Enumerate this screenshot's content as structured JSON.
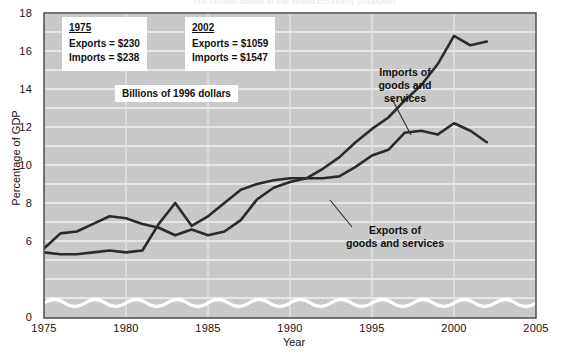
{
  "figure": {
    "top_cut_title": "The United States in the World Economy (cropped)"
  },
  "axes": {
    "y_label": "Percentage of GDP",
    "x_label": "Year",
    "y_ticks": [
      "18",
      "16",
      "14",
      "12",
      "10",
      "8",
      "6",
      "0"
    ],
    "x_ticks": [
      "1975",
      "1980",
      "1985",
      "1990",
      "1995",
      "2000",
      "2005"
    ]
  },
  "annotations": {
    "imports_callout": [
      "Imports of",
      "goods and",
      "services"
    ],
    "exports_callout": [
      "Exports of",
      "goods and services"
    ],
    "unit_note": "Billions of 1996 dollars",
    "box_1975": {
      "year": "1975",
      "exports": "Exports  =  $230",
      "imports": "Imports  =  $238"
    },
    "box_2002": {
      "year": "2002",
      "exports": "Exports  =  $1059",
      "imports": "Imports  =  $1547"
    }
  },
  "colors": {
    "plot_background": "#c9c9c9",
    "gridline": "#efefef",
    "line": "#2b2b2b",
    "axis_break": "#ffffff",
    "frame": "#555555",
    "text": "#111111"
  },
  "chart_data": {
    "type": "line",
    "title": "",
    "xlabel": "Year",
    "ylabel": "Percentage of GDP",
    "xlim": [
      1975,
      2005
    ],
    "ylim": [
      5,
      18
    ],
    "y_axis_break": true,
    "y_axis_break_note": "Axis broken between 0 and ~5.2 (wavy white band near baseline)",
    "grid": true,
    "legend": "inline annotations",
    "x": [
      1975,
      1976,
      1977,
      1978,
      1979,
      1980,
      1981,
      1982,
      1983,
      1984,
      1985,
      1986,
      1987,
      1988,
      1989,
      1990,
      1991,
      1992,
      1993,
      1994,
      1995,
      1996,
      1997,
      1998,
      1999,
      2000,
      2001,
      2002
    ],
    "series": [
      {
        "name": "Exports of goods and services",
        "values": [
          5.6,
          6.4,
          6.5,
          6.9,
          7.3,
          7.2,
          6.9,
          6.7,
          6.3,
          6.6,
          6.3,
          6.5,
          7.1,
          8.2,
          8.8,
          9.1,
          9.3,
          9.3,
          9.4,
          9.9,
          10.5,
          10.8,
          11.7,
          11.8,
          11.6,
          12.2,
          11.8,
          11.2
        ]
      },
      {
        "name": "Imports of goods and services",
        "values": [
          5.4,
          5.3,
          5.3,
          5.4,
          5.5,
          5.4,
          5.5,
          6.9,
          8.0,
          6.8,
          7.3,
          8.0,
          8.7,
          9.0,
          9.2,
          9.3,
          9.3,
          9.8,
          10.4,
          11.2,
          11.9,
          12.5,
          13.4,
          14.2,
          15.3,
          16.8,
          16.3,
          16.5
        ]
      }
    ]
  }
}
